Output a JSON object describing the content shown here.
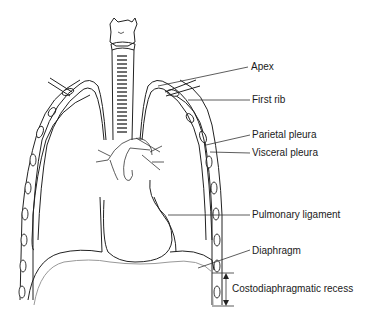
{
  "diagram": {
    "labels": [
      {
        "id": "apex",
        "text": "Apex"
      },
      {
        "id": "first-rib",
        "text": "First rib"
      },
      {
        "id": "parietal-pleura",
        "text": "Parietal pleura"
      },
      {
        "id": "visceral-pleura",
        "text": "Visceral pleura"
      },
      {
        "id": "pulmonary-ligament",
        "text": "Pulmonary ligament"
      },
      {
        "id": "diaphragm",
        "text": "Diaphragm"
      },
      {
        "id": "costodiaphragmatic-recess",
        "text": "Costodiaphragmatic recess"
      }
    ],
    "colors": {
      "line": "#222222",
      "diaphragm_outline": "#999999",
      "background": "#ffffff"
    }
  }
}
